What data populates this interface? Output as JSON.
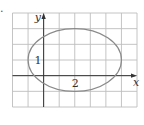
{
  "figure": {
    "fragment_label": ".",
    "axis_labels": {
      "x": "x",
      "y": "y"
    },
    "tick_labels": {
      "x": "2",
      "y": "1"
    },
    "colors": {
      "grid": "#bdbdbd",
      "axes": "#333333",
      "ellipse": "#8a8a8a",
      "text": "#333333"
    }
  },
  "chart_data": {
    "type": "line",
    "title": "",
    "xlabel": "x",
    "ylabel": "y",
    "xlim": [
      -2,
      6
    ],
    "ylim": [
      -2,
      4
    ],
    "grid": true,
    "grid_step": 1,
    "annotations": [
      {
        "text": "1",
        "x": -0.4,
        "y": 1
      },
      {
        "text": "2",
        "x": 2,
        "y": -0.45
      }
    ],
    "series": [
      {
        "name": "ellipse",
        "shape": "ellipse",
        "center": [
          2,
          1
        ],
        "semi_axis_x": 3,
        "semi_axis_y": 2,
        "equation": "(x-2)^2/9 + (y-1)^2/4 = 1"
      }
    ]
  }
}
